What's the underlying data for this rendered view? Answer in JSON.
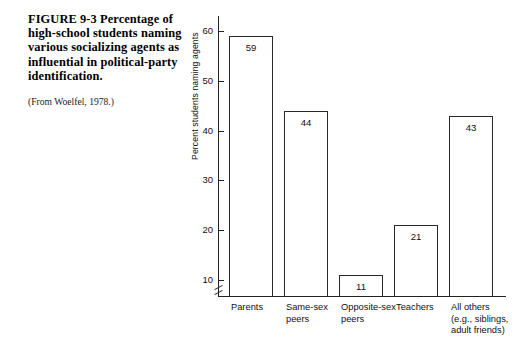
{
  "figure": {
    "caption": "FIGURE 9-3 Percentage of high-school students naming various socializing agents as influential in political-party identification.",
    "source": "(From Woelfel, 1978.)"
  },
  "chart_data": {
    "type": "bar",
    "title": "",
    "xlabel": "",
    "ylabel": "Percent students naming agents",
    "ylim": [
      0,
      65
    ],
    "yticks": [
      10,
      20,
      30,
      40,
      50,
      60
    ],
    "ytick_labels": [
      "10",
      "20",
      "30",
      "40",
      "50",
      "60"
    ],
    "axis_break": true,
    "grid": false,
    "legend": false,
    "categories": [
      "Parents",
      "Same-sex\npeers",
      "Opposite-sex\npeers",
      "Teachers",
      "All others\n(e.g., siblings,\nadult friends)"
    ],
    "values": [
      59,
      44,
      11,
      21,
      43
    ],
    "value_labels": [
      "59",
      "44",
      "11",
      "21",
      "43"
    ],
    "bar_fill": "#ffffff",
    "bar_edge": "#2a2a2a"
  }
}
